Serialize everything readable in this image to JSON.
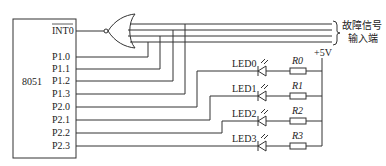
{
  "diagram": {
    "chip": {
      "label": "8051"
    },
    "pins": [
      {
        "name": "INT0",
        "overline": true,
        "y": 31
      },
      {
        "name": "P1.0",
        "y": 57
      },
      {
        "name": "P1.1",
        "y": 69
      },
      {
        "name": "P1.2",
        "y": 81
      },
      {
        "name": "P1.3",
        "y": 94
      },
      {
        "name": "P2.0",
        "y": 107
      },
      {
        "name": "P2.1",
        "y": 120
      },
      {
        "name": "P2.2",
        "y": 133
      },
      {
        "name": "P2.3",
        "y": 146
      }
    ],
    "gate": {
      "type": "NOR",
      "output_to": "INT0"
    },
    "fault_input": {
      "line1": "故障信号",
      "line2": "输入端"
    },
    "supply": {
      "label": "+5V"
    },
    "leds": [
      {
        "label": "LED0",
        "resistor": "R0"
      },
      {
        "label": "LED1",
        "resistor": "R1"
      },
      {
        "label": "LED2",
        "resistor": "R2"
      },
      {
        "label": "LED3",
        "resistor": "R3"
      }
    ],
    "colors": {
      "line": "#333333",
      "text": "#222222",
      "background": "#ffffff"
    }
  }
}
